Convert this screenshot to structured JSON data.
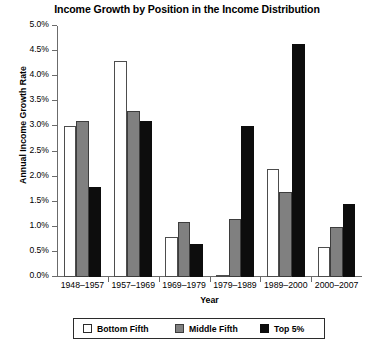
{
  "chart_data": {
    "type": "bar",
    "title": "Income Growth by Position in the Income Distribution",
    "xlabel": "Year",
    "ylabel": "Annual Income Growth Rate",
    "categories": [
      "1948–1957",
      "1957–1969",
      "1969–1979",
      "1979–1989",
      "1989–2000",
      "2000–2007"
    ],
    "series": [
      {
        "name": "Bottom Fifth",
        "color": "#ffffff",
        "values": [
          3.0,
          4.3,
          0.8,
          0.05,
          2.15,
          0.6
        ]
      },
      {
        "name": "Middle Fifth",
        "color": "#808080",
        "values": [
          3.1,
          3.3,
          1.1,
          1.15,
          1.7,
          1.0
        ]
      },
      {
        "name": "Top 5%",
        "color": "#0d0d0d",
        "values": [
          1.8,
          3.1,
          0.65,
          3.0,
          4.65,
          1.45
        ]
      }
    ],
    "ylim": [
      0.0,
      5.0
    ],
    "ytick_values": [
      0.0,
      0.5,
      1.0,
      1.5,
      2.0,
      2.5,
      3.0,
      3.5,
      4.0,
      4.5,
      5.0
    ],
    "ytick_labels": [
      "0.0%",
      "0.5%",
      "1.0%",
      "1.5%",
      "2.0%",
      "2.5%",
      "3.0%",
      "3.5%",
      "4.0%",
      "4.5%",
      "5.0%"
    ],
    "grid": false,
    "legend_position": "bottom"
  }
}
